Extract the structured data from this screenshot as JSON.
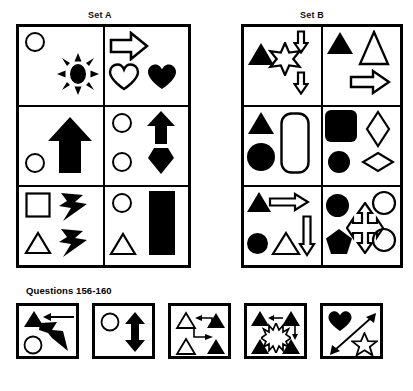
{
  "page": {
    "questions_label": "Questions 156-160",
    "ink_color": "#000000",
    "paper_color": "#ffffff"
  },
  "sets": [
    {
      "id": "set-a",
      "title": "Set A",
      "cells": [
        {
          "position": "row1-col1",
          "shapes": [
            "circle-outline",
            "sunburst-filled"
          ]
        },
        {
          "position": "row1-col2",
          "shapes": [
            "arrow-right-outline",
            "heart-outline",
            "heart-filled"
          ]
        },
        {
          "position": "row2-col1",
          "shapes": [
            "circle-outline",
            "arrow-up-filled"
          ]
        },
        {
          "position": "row2-col2",
          "shapes": [
            "circle-outline",
            "circle-outline",
            "arrow-up-filled",
            "hexagon-filled"
          ]
        },
        {
          "position": "row3-col1",
          "shapes": [
            "square-outline",
            "triangle-outline",
            "lightning-filled",
            "lightning-filled"
          ]
        },
        {
          "position": "row3-col2",
          "shapes": [
            "circle-outline",
            "triangle-outline",
            "rectangle-filled"
          ]
        }
      ]
    },
    {
      "id": "set-b",
      "title": "Set B",
      "cells": [
        {
          "position": "row1-col1",
          "shapes": [
            "triangle-filled",
            "star6-outline",
            "arrow-down-outline",
            "arrow-down-outline"
          ]
        },
        {
          "position": "row1-col2",
          "shapes": [
            "triangle-filled",
            "triangle-outline",
            "arrow-right-outline"
          ]
        },
        {
          "position": "row2-col1",
          "shapes": [
            "triangle-filled",
            "circle-filled",
            "rounded-rect-outline"
          ]
        },
        {
          "position": "row2-col2",
          "shapes": [
            "rounded-square-filled",
            "circle-filled",
            "diamond-tall-outline",
            "diamond-wide-outline"
          ]
        },
        {
          "position": "row3-col1",
          "shapes": [
            "triangle-filled",
            "arrow-right-outline",
            "circle-filled",
            "triangle-outline",
            "arrow-down-outline"
          ]
        },
        {
          "position": "row3-col2",
          "shapes": [
            "circle-filled",
            "pentagon-filled",
            "cross-arrow-outline",
            "circle-outline",
            "circle-outline"
          ]
        }
      ]
    }
  ],
  "options": [
    {
      "id": "option-a",
      "shapes": [
        "triangle-filled",
        "arrow-left-thin",
        "lightning-filled",
        "circle-outline"
      ]
    },
    {
      "id": "option-b",
      "shapes": [
        "circle-outline",
        "double-arrow-vertical-filled"
      ]
    },
    {
      "id": "option-c",
      "shapes": [
        "triangle-outline",
        "triangle-filled",
        "triangle-outline",
        "triangle-filled",
        "zigzag-arrow-left",
        "zigzag-arrow-right"
      ]
    },
    {
      "id": "option-d",
      "shapes": [
        "triangle-filled",
        "triangle-filled",
        "triangle-filled",
        "triangle-filled",
        "sunburst-outline",
        "arrow-left-thin",
        "arrow-down-thin"
      ]
    },
    {
      "id": "option-e",
      "shapes": [
        "heart-filled",
        "star5-outline",
        "double-arrow-diagonal-thin"
      ]
    }
  ]
}
